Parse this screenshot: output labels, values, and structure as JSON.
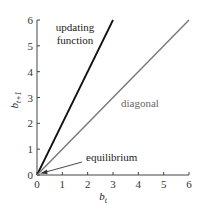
{
  "chart_data": {
    "type": "line",
    "title": "",
    "xlabel": "b_t",
    "ylabel": "b_{t+1}",
    "xlim": [
      0,
      6
    ],
    "ylim": [
      0,
      6
    ],
    "grid": false,
    "x_ticks": [
      "0",
      "1",
      "2",
      "3",
      "4",
      "5",
      "6"
    ],
    "y_ticks": [
      "0",
      "1",
      "2",
      "3",
      "4",
      "5",
      "6"
    ],
    "series": [
      {
        "name": "updating function",
        "color": "#111111",
        "x": [
          0,
          3
        ],
        "y": [
          0,
          6
        ]
      },
      {
        "name": "diagonal",
        "color": "#777777",
        "x": [
          0,
          6
        ],
        "y": [
          0,
          6
        ]
      }
    ],
    "annotations": [
      {
        "text_lines": [
          "updating",
          "function"
        ],
        "target": "updating function line"
      },
      {
        "text": "diagonal",
        "target": "diagonal line"
      },
      {
        "text": "equilibrium",
        "arrow_to": [
          0,
          0
        ]
      }
    ]
  },
  "labels": {
    "updating_line1": "updating",
    "updating_line2": "function",
    "diagonal": "diagonal",
    "equilibrium": "equilibrium",
    "xlabel_main": "b",
    "xlabel_sub": "t",
    "ylabel_main": "b",
    "ylabel_sub": "t+1"
  }
}
